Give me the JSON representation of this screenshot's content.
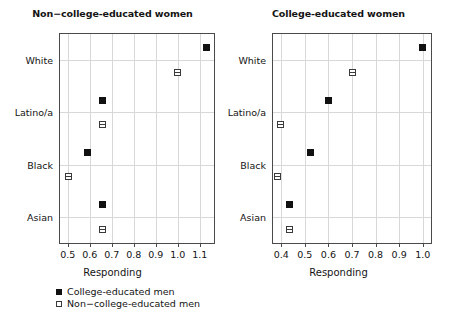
{
  "chart_data": {
    "type": "scatter",
    "title": "",
    "panels": [
      {
        "title": "Non−college-educated women",
        "xlabel": "Responding",
        "ylabel": "",
        "xlim": [
          0.465,
          1.165
        ],
        "xticks": [
          0.5,
          0.6,
          0.7,
          0.8,
          0.9,
          1.0,
          1.1
        ],
        "xticklabels": [
          "0.5",
          "0.6",
          "0.7",
          "0.8",
          "0.9",
          "1.0",
          "1.1"
        ],
        "categories": [
          "White",
          "Latino/a",
          "Black",
          "Asian"
        ],
        "grid": true,
        "series": [
          {
            "name": "College-educated men",
            "marker": "filled-square",
            "values": [
              1.13,
              0.66,
              0.592,
              0.66
            ]
          },
          {
            "name": "Non−college-educated men",
            "marker": "open-square",
            "values": [
              1.0,
              0.66,
              0.505,
              0.66
            ]
          }
        ]
      },
      {
        "title": "College-educated women",
        "xlabel": "Responding",
        "ylabel": "",
        "xlim": [
          0.365,
          1.035
        ],
        "xticks": [
          0.4,
          0.5,
          0.6,
          0.7,
          0.8,
          0.9,
          1.0
        ],
        "xticklabels": [
          "0.4",
          "0.5",
          "0.6",
          "0.7",
          "0.8",
          "0.9",
          "1.0"
        ],
        "categories": [
          "White",
          "Latino/a",
          "Black",
          "Asian"
        ],
        "grid": true,
        "series": [
          {
            "name": "College-educated men",
            "marker": "filled-square",
            "values": [
              1.0,
              0.602,
              0.522,
              0.436
            ]
          },
          {
            "name": "Non−college-educated men",
            "marker": "open-square",
            "values": [
              0.7,
              0.395,
              0.385,
              0.436
            ]
          }
        ]
      }
    ],
    "legend": {
      "position": "bottom-left",
      "entries": [
        {
          "label": "College-educated men",
          "marker": "filled-square"
        },
        {
          "label": "Non−college-educated men",
          "marker": "open-square"
        }
      ]
    },
    "colors": {
      "marker_fill": "#111111",
      "marker_edge": "#3a3a3a",
      "grid": "#d8d8d8",
      "axis": "#4a4a4a",
      "background": "#ffffff",
      "text": "#141414"
    }
  }
}
